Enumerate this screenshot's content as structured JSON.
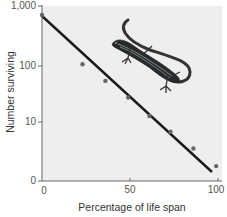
{
  "chart_data": {
    "type": "scatter",
    "title": "",
    "xlabel": "Percentage of life span",
    "ylabel": "Number surviving",
    "xscale": "linear",
    "yscale": "log",
    "xlim": [
      0,
      100
    ],
    "ylim": [
      1,
      1000
    ],
    "x_ticks": [
      0,
      50,
      100
    ],
    "x_tick_labels": [
      "0",
      "50",
      "100"
    ],
    "y_ticks": [
      1,
      10,
      100,
      1000
    ],
    "y_tick_labels": [
      "0",
      "10",
      "100",
      "1,000"
    ],
    "grid": false,
    "legend": null,
    "series": [
      {
        "name": "Observed survivors",
        "kind": "points",
        "x": [
          0,
          23,
          36,
          49,
          61,
          73,
          86,
          99
        ],
        "y": [
          700,
          100,
          52,
          27,
          13,
          7,
          3.6,
          1.8
        ]
      },
      {
        "name": "Survivorship trend",
        "kind": "line",
        "x": [
          0,
          97
        ],
        "y": [
          700,
          1.3
        ]
      }
    ],
    "annotations": [
      "Lizard illustration in upper right of plot area"
    ]
  },
  "colors": {
    "plot_background": "#eeeeee",
    "line": "#1a1a1a",
    "points": "#666666",
    "axis": "#555555"
  }
}
